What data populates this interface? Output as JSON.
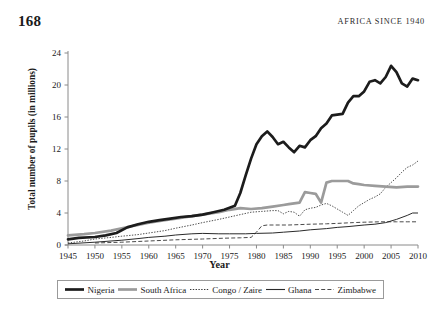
{
  "page": {
    "folio": "168",
    "running_title": "AFRICA SINCE 1940"
  },
  "chart_data": {
    "type": "line",
    "title": "",
    "xlabel": "Year",
    "ylabel": "Total number of pupils (in millions)",
    "xlim": [
      1945,
      2010
    ],
    "ylim": [
      0,
      24
    ],
    "xticks": [
      1945,
      1950,
      1955,
      1960,
      1965,
      1970,
      1975,
      1980,
      1985,
      1990,
      1995,
      2000,
      2005,
      2010
    ],
    "yticks": [
      0,
      4,
      8,
      12,
      16,
      20,
      24
    ],
    "grid": false,
    "legend_position": "below-axes",
    "series": [
      {
        "name": "Nigeria",
        "style": "solid-thick",
        "color": "#1c1c1c",
        "points": [
          [
            1945,
            0.7
          ],
          [
            1947,
            0.9
          ],
          [
            1950,
            1.0
          ],
          [
            1952,
            1.2
          ],
          [
            1954,
            1.5
          ],
          [
            1956,
            2.2
          ],
          [
            1958,
            2.6
          ],
          [
            1960,
            2.9
          ],
          [
            1962,
            3.1
          ],
          [
            1964,
            3.3
          ],
          [
            1966,
            3.5
          ],
          [
            1968,
            3.6
          ],
          [
            1970,
            3.8
          ],
          [
            1972,
            4.1
          ],
          [
            1974,
            4.4
          ],
          [
            1976,
            4.9
          ],
          [
            1977,
            6.5
          ],
          [
            1978,
            8.7
          ],
          [
            1979,
            10.8
          ],
          [
            1980,
            12.6
          ],
          [
            1981,
            13.6
          ],
          [
            1982,
            14.2
          ],
          [
            1983,
            13.5
          ],
          [
            1984,
            12.6
          ],
          [
            1985,
            12.9
          ],
          [
            1986,
            12.2
          ],
          [
            1987,
            11.6
          ],
          [
            1988,
            12.4
          ],
          [
            1989,
            12.2
          ],
          [
            1990,
            13.1
          ],
          [
            1991,
            13.6
          ],
          [
            1992,
            14.6
          ],
          [
            1993,
            15.2
          ],
          [
            1994,
            16.2
          ],
          [
            1995,
            16.3
          ],
          [
            1996,
            16.4
          ],
          [
            1997,
            17.8
          ],
          [
            1998,
            18.6
          ],
          [
            1999,
            18.6
          ],
          [
            2000,
            19.2
          ],
          [
            2001,
            20.4
          ],
          [
            2002,
            20.6
          ],
          [
            2003,
            20.2
          ],
          [
            2004,
            21.0
          ],
          [
            2005,
            22.4
          ],
          [
            2006,
            21.6
          ],
          [
            2007,
            20.2
          ],
          [
            2008,
            19.8
          ],
          [
            2009,
            20.8
          ],
          [
            2010,
            20.6
          ]
        ]
      },
      {
        "name": "South Africa",
        "style": "solid-thick",
        "color": "#9b9b9b",
        "points": [
          [
            1945,
            1.2
          ],
          [
            1948,
            1.35
          ],
          [
            1950,
            1.5
          ],
          [
            1953,
            1.8
          ],
          [
            1955,
            2.1
          ],
          [
            1958,
            2.5
          ],
          [
            1960,
            2.8
          ],
          [
            1963,
            3.1
          ],
          [
            1965,
            3.3
          ],
          [
            1968,
            3.6
          ],
          [
            1970,
            3.8
          ],
          [
            1973,
            4.1
          ],
          [
            1975,
            4.4
          ],
          [
            1977,
            4.6
          ],
          [
            1979,
            4.5
          ],
          [
            1981,
            4.6
          ],
          [
            1983,
            4.8
          ],
          [
            1985,
            5.0
          ],
          [
            1986,
            5.1
          ],
          [
            1987,
            5.2
          ],
          [
            1988,
            5.3
          ],
          [
            1989,
            6.6
          ],
          [
            1990,
            6.5
          ],
          [
            1991,
            6.4
          ],
          [
            1992,
            5.3
          ],
          [
            1993,
            7.8
          ],
          [
            1994,
            8.0
          ],
          [
            1995,
            8.0
          ],
          [
            1996,
            8.0
          ],
          [
            1997,
            8.0
          ],
          [
            1998,
            7.7
          ],
          [
            1999,
            7.6
          ],
          [
            2000,
            7.5
          ],
          [
            2002,
            7.4
          ],
          [
            2004,
            7.3
          ],
          [
            2006,
            7.2
          ],
          [
            2008,
            7.3
          ],
          [
            2010,
            7.3
          ]
        ]
      },
      {
        "name": "Congo / Zaire",
        "style": "dotted",
        "color": "#3a3a3a",
        "points": [
          [
            1945,
            0.25
          ],
          [
            1948,
            0.5
          ],
          [
            1950,
            0.75
          ],
          [
            1953,
            0.95
          ],
          [
            1955,
            1.1
          ],
          [
            1958,
            1.3
          ],
          [
            1960,
            1.5
          ],
          [
            1963,
            1.8
          ],
          [
            1965,
            2.1
          ],
          [
            1968,
            2.5
          ],
          [
            1970,
            2.8
          ],
          [
            1973,
            3.2
          ],
          [
            1975,
            3.5
          ],
          [
            1977,
            3.8
          ],
          [
            1979,
            4.1
          ],
          [
            1981,
            4.2
          ],
          [
            1983,
            4.3
          ],
          [
            1984,
            4.3
          ],
          [
            1985,
            3.9
          ],
          [
            1986,
            4.2
          ],
          [
            1987,
            4.1
          ],
          [
            1988,
            3.6
          ],
          [
            1989,
            4.4
          ],
          [
            1990,
            4.6
          ],
          [
            1991,
            4.7
          ],
          [
            1992,
            5.0
          ],
          [
            1993,
            5.2
          ],
          [
            1994,
            4.9
          ],
          [
            1995,
            4.5
          ],
          [
            1996,
            4.1
          ],
          [
            1997,
            3.7
          ],
          [
            1998,
            4.3
          ],
          [
            1999,
            4.9
          ],
          [
            2000,
            5.3
          ],
          [
            2001,
            5.7
          ],
          [
            2002,
            6.0
          ],
          [
            2003,
            6.4
          ],
          [
            2004,
            7.2
          ],
          [
            2005,
            7.8
          ],
          [
            2006,
            8.4
          ],
          [
            2007,
            9.1
          ],
          [
            2008,
            9.7
          ],
          [
            2009,
            10.0
          ],
          [
            2010,
            10.5
          ]
        ]
      },
      {
        "name": "Ghana",
        "style": "solid-thin",
        "color": "#2a2a2a",
        "points": [
          [
            1945,
            0.15
          ],
          [
            1950,
            0.35
          ],
          [
            1955,
            0.6
          ],
          [
            1958,
            0.8
          ],
          [
            1960,
            0.95
          ],
          [
            1963,
            1.1
          ],
          [
            1965,
            1.25
          ],
          [
            1968,
            1.4
          ],
          [
            1970,
            1.45
          ],
          [
            1973,
            1.4
          ],
          [
            1975,
            1.4
          ],
          [
            1978,
            1.4
          ],
          [
            1980,
            1.45
          ],
          [
            1983,
            1.5
          ],
          [
            1985,
            1.6
          ],
          [
            1988,
            1.75
          ],
          [
            1990,
            1.9
          ],
          [
            1993,
            2.05
          ],
          [
            1995,
            2.2
          ],
          [
            1997,
            2.3
          ],
          [
            2000,
            2.5
          ],
          [
            2002,
            2.6
          ],
          [
            2004,
            2.8
          ],
          [
            2006,
            3.2
          ],
          [
            2008,
            3.7
          ],
          [
            2009,
            4.0
          ],
          [
            2010,
            4.0
          ]
        ]
      },
      {
        "name": "Zimbabwe",
        "style": "dashed",
        "color": "#4a4a4a",
        "points": [
          [
            1950,
            0.25
          ],
          [
            1955,
            0.35
          ],
          [
            1960,
            0.5
          ],
          [
            1965,
            0.65
          ],
          [
            1970,
            0.75
          ],
          [
            1974,
            0.85
          ],
          [
            1977,
            0.9
          ],
          [
            1979,
            0.95
          ],
          [
            1980,
            1.6
          ],
          [
            1981,
            2.4
          ],
          [
            1982,
            2.5
          ],
          [
            1984,
            2.5
          ],
          [
            1986,
            2.5
          ],
          [
            1988,
            2.55
          ],
          [
            1990,
            2.6
          ],
          [
            1993,
            2.65
          ],
          [
            1995,
            2.7
          ],
          [
            1998,
            2.8
          ],
          [
            2000,
            2.85
          ],
          [
            2003,
            2.9
          ],
          [
            2006,
            2.9
          ],
          [
            2008,
            2.9
          ],
          [
            2010,
            2.9
          ]
        ]
      }
    ]
  },
  "legend": {
    "items": [
      {
        "label": "Nigeria",
        "style": "solid-thick",
        "color": "#1c1c1c"
      },
      {
        "label": "South Africa",
        "style": "solid-thick",
        "color": "#9b9b9b"
      },
      {
        "label": "Congo / Zaire",
        "style": "dotted",
        "color": "#3a3a3a"
      },
      {
        "label": "Ghana",
        "style": "solid-thin",
        "color": "#2a2a2a"
      },
      {
        "label": "Zimbabwe",
        "style": "dashed",
        "color": "#4a4a4a"
      }
    ]
  }
}
